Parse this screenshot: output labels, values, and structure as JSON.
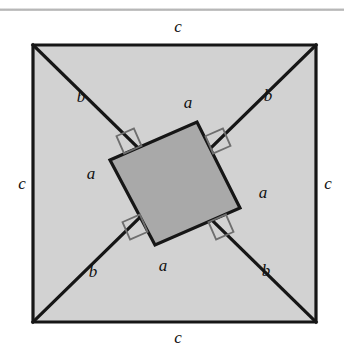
{
  "figure": {
    "type": "geometric-diagram",
    "colors": {
      "outer_square_fill": "#d2d2d2",
      "inner_square_fill": "#a9a9a9",
      "line": "#161616",
      "right_angle_mark": "#6e6e6e",
      "background": "#ffffff",
      "label": "#111111"
    },
    "outer_square": {
      "x": 33,
      "y": 45,
      "width": 283,
      "height": 277,
      "stroke_width": 3.2
    },
    "inner_square": {
      "vertices": [
        {
          "x": 110,
          "y": 160
        },
        {
          "x": 197,
          "y": 122
        },
        {
          "x": 240,
          "y": 208
        },
        {
          "x": 155,
          "y": 245
        }
      ],
      "stroke_width": 3.2
    },
    "diagonals": [
      {
        "x1": 33,
        "y1": 45,
        "x2": 316,
        "y2": 322,
        "stroke_width": 3.2
      },
      {
        "x1": 316,
        "y1": 45,
        "x2": 33,
        "y2": 322,
        "stroke_width": 3.2
      }
    ],
    "right_angle_marks": [
      {
        "cx": 129,
        "cy": 141,
        "label": "right-angle-upper-left"
      },
      {
        "cx": 218,
        "cy": 141,
        "label": "right-angle-upper-right"
      },
      {
        "cx": 221,
        "cy": 227,
        "label": "right-angle-lower-right"
      },
      {
        "cx": 135,
        "cy": 227,
        "label": "right-angle-lower-left"
      }
    ],
    "scan_artifact_bar": {
      "y": 8
    }
  },
  "labels": {
    "side_top": {
      "text": "c",
      "x": 178,
      "y": 26
    },
    "side_left": {
      "text": "c",
      "x": 22,
      "y": 183
    },
    "side_right": {
      "text": "c",
      "x": 328,
      "y": 183
    },
    "side_bottom": {
      "text": "c",
      "x": 178,
      "y": 337
    },
    "leg_b_top_left": {
      "text": "b",
      "x": 81,
      "y": 96
    },
    "leg_b_top_right": {
      "text": "b",
      "x": 268,
      "y": 95
    },
    "leg_b_bottom_left": {
      "text": "b",
      "x": 93,
      "y": 271
    },
    "leg_b_bottom_right": {
      "text": "b",
      "x": 266,
      "y": 270
    },
    "leg_a_left": {
      "text": "a",
      "x": 91,
      "y": 173
    },
    "leg_a_top": {
      "text": "a",
      "x": 188,
      "y": 102
    },
    "leg_a_right": {
      "text": "a",
      "x": 263,
      "y": 192
    },
    "leg_a_bottom": {
      "text": "a",
      "x": 163,
      "y": 265
    }
  }
}
